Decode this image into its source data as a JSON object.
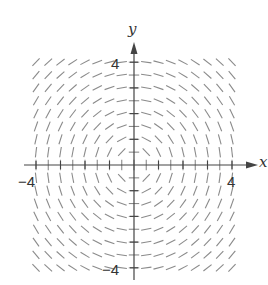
{
  "diagram": {
    "type": "slope_field",
    "equation_implied": "dy/dx = -x/y",
    "x_axis": {
      "label": "x",
      "range": [
        -4,
        4
      ],
      "tick_labels": [
        "-4",
        "4"
      ],
      "tick_step": 0.5
    },
    "y_axis": {
      "label": "y",
      "range": [
        -4,
        4
      ],
      "tick_labels": [
        "4",
        "-4"
      ],
      "tick_step": 0.5
    },
    "grid_step": 0.5,
    "segment_color": "#8a8a8a",
    "axis_color": "#444444"
  },
  "labels": {
    "x_axis_name": "x",
    "y_axis_name": "y",
    "x_min": "−4",
    "x_max": "4",
    "y_max": "4",
    "y_min": "−4"
  }
}
